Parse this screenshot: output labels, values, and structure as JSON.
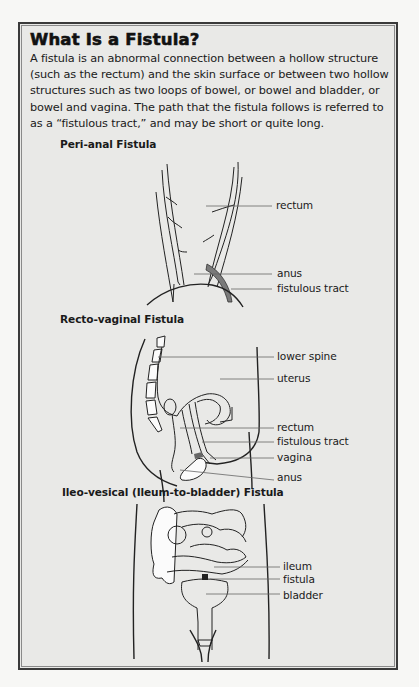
{
  "document": {
    "title": "What Is a Fistula?",
    "intro": "A fistula is an abnormal connection between a hollow structure (such as the rectum) and the skin surface or between two hollow structures such as two loops of bowel, or bowel and bladder, or bowel and vagina. The path that the fistula follows is referred to as a “fistulous tract,” and may be short or quite long."
  },
  "figures": [
    {
      "title": "Peri-anal Fistula",
      "labels": [
        "rectum",
        "anus",
        "fistulous tract"
      ]
    },
    {
      "title": "Recto-vaginal Fistula",
      "labels": [
        "lower spine",
        "uterus",
        "rectum",
        "fistulous tract",
        "vagina",
        "anus"
      ]
    },
    {
      "title": "Ileo-vesical (Ileum-to-bladder) Fistula",
      "labels": [
        "ileum",
        "fistula",
        "bladder"
      ]
    }
  ],
  "colors": {
    "panel_background": "#e9e9e7",
    "border": "#3a3a3a",
    "fistulous_tract": "#7a7a7a"
  }
}
